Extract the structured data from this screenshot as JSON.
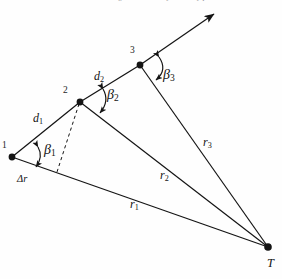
{
  "figure": {
    "domain": "Diagram",
    "kind": "geometric-ray-diagram",
    "caption_partial": "Figure 4. Geometry of the ray path",
    "background_color": "#fefefe",
    "ink_color": "#141414",
    "points": [
      {
        "id": "p1",
        "label": "1",
        "x": 12,
        "y": 157
      },
      {
        "id": "p2",
        "label": "2",
        "x": 80,
        "y": 102
      },
      {
        "id": "p3",
        "label": "3",
        "x": 140,
        "y": 65
      },
      {
        "id": "pT",
        "label": "T",
        "x": 268,
        "y": 247
      }
    ],
    "segment_labels": [
      {
        "id": "d1",
        "base": "d",
        "sub": "1"
      },
      {
        "id": "d2",
        "base": "d",
        "sub": "2"
      }
    ],
    "angle_labels": [
      {
        "id": "b1",
        "base": "β",
        "sub": "1"
      },
      {
        "id": "b2",
        "base": "β",
        "sub": "2"
      },
      {
        "id": "b3",
        "base": "β",
        "sub": "3"
      }
    ],
    "range_labels": [
      {
        "id": "r1",
        "base": "r",
        "sub": "1"
      },
      {
        "id": "r2",
        "base": "r",
        "sub": "2"
      },
      {
        "id": "r3",
        "base": "r",
        "sub": "3"
      }
    ],
    "delta_label": "Δr",
    "target_label": "T",
    "point1_label": "1",
    "point2_label": "2",
    "point3_label": "3"
  }
}
